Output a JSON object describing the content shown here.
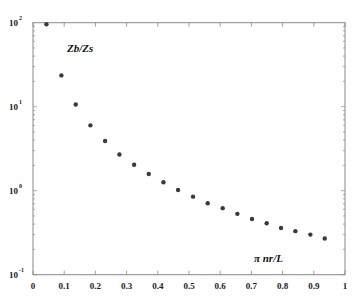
{
  "chart_data": {
    "type": "scatter",
    "title": "",
    "xlabel": "π nr/L",
    "ylabel": "Zb/Zs",
    "annotations": [
      {
        "text": "Zb/Zs",
        "x": 0.11,
        "y": 45
      },
      {
        "text": "π nr/L",
        "x": 0.78,
        "y": 0.14
      }
    ],
    "x_scale": "linear",
    "y_scale": "log",
    "xlim": [
      0,
      1
    ],
    "ylim": [
      0.1,
      100
    ],
    "x_ticks": [
      "0",
      "0.1",
      "0.2",
      "0.3",
      "0.4",
      "0.5",
      "0.6",
      "0.7",
      "0.8",
      "0.9",
      "1"
    ],
    "y_ticks": [
      {
        "base": "10",
        "exp": "-1",
        "value": 0.1
      },
      {
        "base": "10",
        "exp": "0",
        "value": 1
      },
      {
        "base": "10",
        "exp": "1",
        "value": 10
      },
      {
        "base": "10",
        "exp": "2",
        "value": 100
      }
    ],
    "grid": false,
    "legend": null,
    "series": [
      {
        "name": "Zb/Zs",
        "color": "#3a3a3a",
        "x": [
          0.043,
          0.091,
          0.137,
          0.184,
          0.231,
          0.277,
          0.324,
          0.371,
          0.418,
          0.465,
          0.513,
          0.56,
          0.608,
          0.655,
          0.702,
          0.749,
          0.795,
          0.841,
          0.889,
          0.935
        ],
        "y": [
          96,
          23.6,
          10.6,
          6.0,
          3.9,
          2.7,
          2.04,
          1.58,
          1.26,
          1.02,
          0.85,
          0.71,
          0.62,
          0.53,
          0.46,
          0.41,
          0.36,
          0.33,
          0.3,
          0.27
        ]
      }
    ]
  },
  "colors": {
    "axis": "#888888",
    "marker": "#3a3a3a",
    "text": "#222222"
  }
}
